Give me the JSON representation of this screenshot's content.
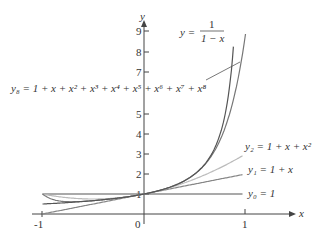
{
  "chart_data": {
    "type": "line",
    "title": "",
    "xlabel": "x",
    "ylabel": "y",
    "xlim": [
      -1,
      1
    ],
    "ylim": [
      0,
      9
    ],
    "x_ticks": [
      "-1",
      "0",
      "1"
    ],
    "y_ticks": [
      "1",
      "2",
      "3",
      "4",
      "5",
      "7",
      "8",
      "9"
    ],
    "grid": false,
    "series": [
      {
        "name": "y = 1/(1 - x)",
        "label_main": "y = ",
        "label_num": "1",
        "label_den": "1 − x",
        "color": "#555555"
      },
      {
        "name": "y8 = 1 + x + x^2 + x^3 + x^4 + x^5 + x^6 + x^7 + x^8",
        "label": "y₈ = 1 + x + x² + x³ + x⁴ + x⁵ + x⁶ + x⁷ + x⁸",
        "color": "#777777"
      },
      {
        "name": "y2 = 1 + x + x^2",
        "label": "y₂ = 1 + x + x²",
        "color": "#bbbbbb"
      },
      {
        "name": "y1 = 1 + x",
        "label": "y₁ = 1 + x",
        "color": "#888888"
      },
      {
        "name": "y0 = 1",
        "label": "y₀ = 1",
        "color": "#555555"
      }
    ]
  }
}
